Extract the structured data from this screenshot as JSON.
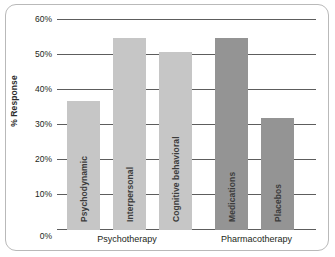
{
  "chart_data": {
    "type": "bar",
    "title": "",
    "xlabel": "",
    "ylabel": "% Response",
    "ylim": [
      0,
      60
    ],
    "grid": true,
    "legend_position": "none",
    "yticks": [
      "0%",
      "10%",
      "20%",
      "30%",
      "40%",
      "50%",
      "60%"
    ],
    "ytick_values": [
      0,
      10,
      20,
      30,
      40,
      50,
      60
    ],
    "categories": [
      "Psychodynamic",
      "Interpersonal",
      "Cognitive behavioral",
      "Medications",
      "Placebos"
    ],
    "values": [
      37,
      55,
      51,
      55,
      32
    ],
    "groups": [
      {
        "label": "Psychotherapy",
        "categories": [
          "Psychodynamic",
          "Interpersonal",
          "Cognitive behavioral"
        ]
      },
      {
        "label": "Pharmacotherapy",
        "categories": [
          "Medications",
          "Placebos"
        ]
      }
    ],
    "colors": {
      "psychotherapy_bar": "#c6c6c6",
      "pharmacotherapy_bar": "#949494",
      "gridline": "#5d5d5d",
      "frame_border": "#b9b9b9",
      "text": "#231f20",
      "background": "#ffffff"
    },
    "bars": [
      {
        "label": "Psychodynamic",
        "value": 37,
        "group": "Psychotherapy",
        "color": "#c6c6c6",
        "x": 10,
        "width": 33
      },
      {
        "label": "Interpersonal",
        "value": 55,
        "group": "Psychotherapy",
        "color": "#c6c6c6",
        "x": 56,
        "width": 33
      },
      {
        "label": "Cognitive behavioral",
        "value": 51,
        "group": "Psychotherapy",
        "color": "#c6c6c6",
        "x": 102,
        "width": 33
      },
      {
        "label": "Medications",
        "value": 55,
        "group": "Pharmacotherapy",
        "color": "#949494",
        "x": 158,
        "width": 33
      },
      {
        "label": "Placebos",
        "value": 32,
        "group": "Pharmacotherapy",
        "color": "#949494",
        "x": 204,
        "width": 33
      }
    ],
    "group_positions": [
      {
        "label": "Psychotherapy",
        "left": 57,
        "width": 140
      },
      {
        "label": "Pharmacotherapy",
        "left": 197,
        "width": 119
      }
    ]
  }
}
